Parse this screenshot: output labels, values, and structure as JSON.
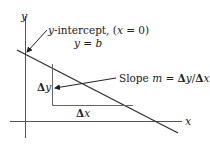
{
  "diagram": {
    "axes": {
      "y_label": "y",
      "x_label": "x"
    },
    "annotations": {
      "intercept_line1": "y-intercept, (x = 0)",
      "intercept_line2": "y = b",
      "slope": "Slope m = Δy/Δx",
      "delta_y": "Δy",
      "delta_x": "Δx"
    },
    "colors": {
      "line": "#333333",
      "axis": "#444444",
      "text": "#222222"
    }
  }
}
